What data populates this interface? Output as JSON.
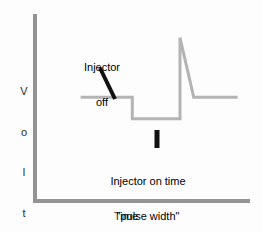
{
  "figure": {
    "background_color": "#fdfdfd",
    "axis_color": "#949494",
    "waveform_color": "#b4b4b4",
    "pointer_color": "#111111",
    "text_color": "#000000"
  },
  "axes": {
    "y_label_text": "Voltage",
    "y_label_letters": [
      "V",
      "o",
      "l",
      "t",
      "a",
      "g",
      "e"
    ],
    "x_label": "Time"
  },
  "annotations": {
    "injector_off": {
      "lines": [
        "Injector",
        "off"
      ],
      "pointer": "diagonal-leader-line"
    },
    "pulse_width": {
      "lines": [
        "Injector on time",
        "\"pulse width\""
      ],
      "pointer": "vertical-tick-mark"
    }
  },
  "chart_data": {
    "type": "line",
    "title": "",
    "xlabel": "Time",
    "ylabel": "Voltage",
    "grid": false,
    "legend": "none",
    "xlim": [
      0,
      100
    ],
    "ylim": [
      0,
      100
    ],
    "axis_ticks": "none",
    "series": [
      {
        "name": "Injector voltage waveform",
        "description": "Battery-level plateau, drop to ground during injector-on time, then inductive flyback voltage spike at turn-off decaying back to battery level",
        "points": [
          {
            "x": 21.6,
            "y": 55.5,
            "note": "waveform start, injector off (battery level)"
          },
          {
            "x": 46.1,
            "y": 55.5,
            "note": "injector turns on"
          },
          {
            "x": 46.1,
            "y": 44.0,
            "note": "voltage pulled down to ground"
          },
          {
            "x": 68.7,
            "y": 44.0,
            "note": "end of injector on time / pulse width"
          },
          {
            "x": 68.7,
            "y": 87.3,
            "note": "inductive flyback spike peak"
          },
          {
            "x": 75.2,
            "y": 55.5,
            "note": "spike decays back to battery level"
          },
          {
            "x": 96.0,
            "y": 55.5,
            "note": "waveform end, injector off"
          }
        ]
      }
    ]
  }
}
